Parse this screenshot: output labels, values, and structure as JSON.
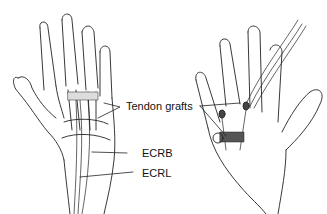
{
  "figure": {
    "labels": {
      "tendon_grafts": "Tendon grafts",
      "ecrb": "ECRB",
      "ecrl": "ECRL"
    },
    "panels": [
      {
        "name": "dorsal-hand-view"
      },
      {
        "name": "palmar-hand-view"
      }
    ]
  }
}
